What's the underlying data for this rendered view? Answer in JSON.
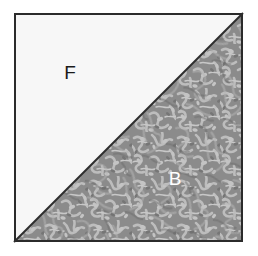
{
  "figure": {
    "canvas": {
      "width": 258,
      "height": 256,
      "background": "#ffffff"
    },
    "square": {
      "name": "image-square",
      "left": 14,
      "top": 13,
      "right": 243,
      "bottom": 242,
      "border_color": "#2b2b2b",
      "border_width": 2
    },
    "regions": [
      {
        "id": "foreground",
        "label": "F",
        "description": "upper-left triangle, plain light fill",
        "fill": "#f7f7f7",
        "label_color": "#1a1a1a",
        "label_x": 70,
        "label_y": 74,
        "label_size": 19,
        "points": "14,13 243,13 14,242"
      },
      {
        "id": "background",
        "label": "B",
        "description": "lower-right triangle, mottled floral gray texture",
        "fill": "#8a8a8a",
        "texture_light": "#b9b9b9",
        "texture_dark": "#6e6e6e",
        "label_color": "#ffffff",
        "label_x": 175,
        "label_y": 180,
        "label_size": 19,
        "points": "243,13 243,242 14,242"
      }
    ],
    "diagonal": {
      "name": "diagonal-divider",
      "color": "#2e2e2e",
      "width": 2,
      "from_x": 14,
      "from_y": 242,
      "to_x": 243,
      "to_y": 13
    }
  }
}
